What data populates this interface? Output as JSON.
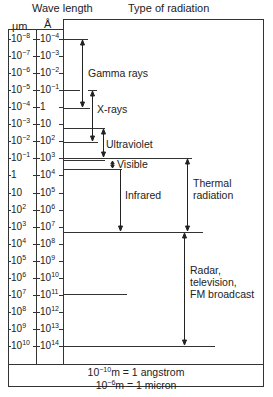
{
  "headers": {
    "wavelength": "Wave length",
    "type": "Type of radiation",
    "unit_um": "µm",
    "unit_angstrom": "Å"
  },
  "scale": {
    "um": [
      {
        "base": "10",
        "exp": "−8"
      },
      {
        "base": "10",
        "exp": "−7"
      },
      {
        "base": "10",
        "exp": "−6"
      },
      {
        "base": "10",
        "exp": "−5"
      },
      {
        "base": "10",
        "exp": "−4"
      },
      {
        "base": "10",
        "exp": "−3"
      },
      {
        "base": "10",
        "exp": "−2"
      },
      {
        "base": "10",
        "exp": "−1"
      },
      {
        "base": "1",
        "exp": ""
      },
      {
        "base": "10",
        "exp": ""
      },
      {
        "base": "10",
        "exp": "2"
      },
      {
        "base": "10",
        "exp": "3"
      },
      {
        "base": "10",
        "exp": "4"
      },
      {
        "base": "10",
        "exp": "5"
      },
      {
        "base": "10",
        "exp": "6"
      },
      {
        "base": "10",
        "exp": "7"
      },
      {
        "base": "10",
        "exp": "8"
      },
      {
        "base": "10",
        "exp": "9"
      },
      {
        "base": "10",
        "exp": "10"
      }
    ],
    "angstrom": [
      {
        "base": "10",
        "exp": "−4"
      },
      {
        "base": "10",
        "exp": "−3"
      },
      {
        "base": "10",
        "exp": "−2"
      },
      {
        "base": "10",
        "exp": "−1"
      },
      {
        "base": "1",
        "exp": ""
      },
      {
        "base": "10",
        "exp": ""
      },
      {
        "base": "10",
        "exp": "2"
      },
      {
        "base": "10",
        "exp": "3"
      },
      {
        "base": "10",
        "exp": "4"
      },
      {
        "base": "10",
        "exp": "5"
      },
      {
        "base": "10",
        "exp": "6"
      },
      {
        "base": "10",
        "exp": "7"
      },
      {
        "base": "10",
        "exp": "8"
      },
      {
        "base": "10",
        "exp": "9"
      },
      {
        "base": "10",
        "exp": "10"
      },
      {
        "base": "10",
        "exp": "11"
      },
      {
        "base": "10",
        "exp": "12"
      },
      {
        "base": "10",
        "exp": "13"
      },
      {
        "base": "10",
        "exp": "14"
      }
    ]
  },
  "radiation": {
    "gamma": "Gamma rays",
    "xray": "X-rays",
    "uv": "Ultraviolet",
    "visible": "Visible",
    "infrared": "Infrared",
    "thermal_1": "Thermal",
    "thermal_2": "radiation",
    "radio_1": "Radar,",
    "radio_2": "television,",
    "radio_3": "FM broadcast"
  },
  "footer": {
    "line1_base": "10",
    "line1_exp": "−10",
    "line1_rest": "m = 1 angstrom",
    "line2_base": "10",
    "line2_exp": "−6",
    "line2_rest": "m = 1 micron"
  }
}
